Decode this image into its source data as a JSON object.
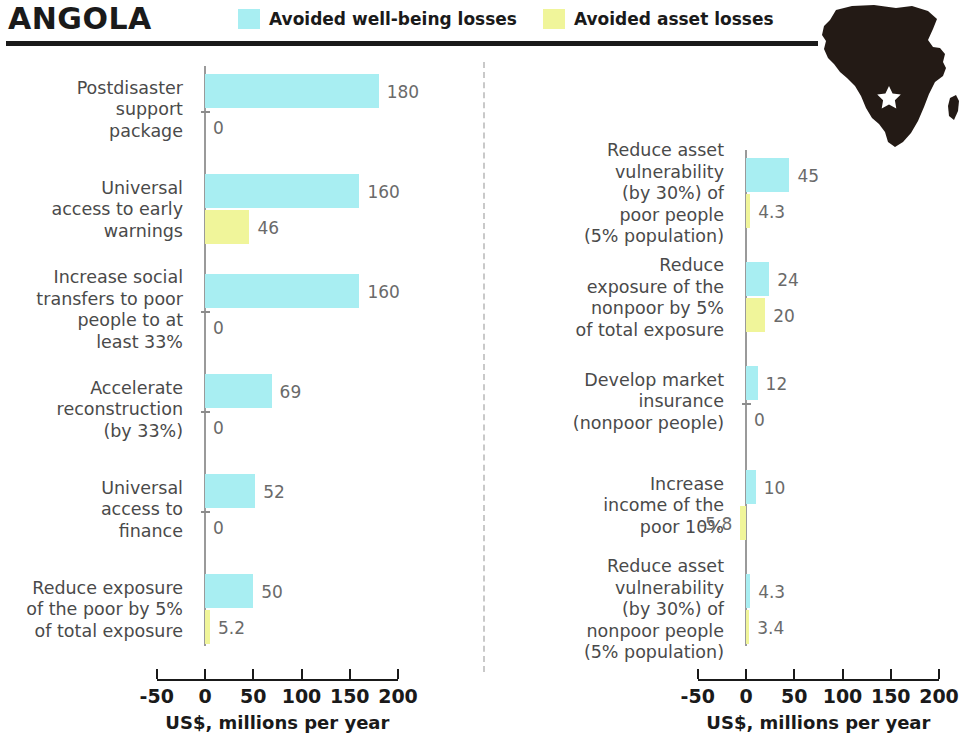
{
  "header": {
    "country": "ANGOLA",
    "legend": [
      {
        "label": "Avoided well-being losses",
        "color": "#A8EEF2",
        "icon": "legend-swatch-wellbeing"
      },
      {
        "label": "Avoided asset losses",
        "color": "#F0F59A",
        "icon": "legend-swatch-asset"
      }
    ]
  },
  "map": {
    "icon": "africa-map-icon",
    "marker": "angola-star-marker",
    "fill": "#231a15",
    "marker_fill": "#ffffff"
  },
  "axis": {
    "title": "US$, millions per year",
    "ticks": [
      -50,
      0,
      50,
      100,
      150,
      200
    ],
    "tick_labels": [
      "-50",
      "0",
      "50",
      "100",
      "150",
      "200"
    ],
    "min": -50,
    "max": 200
  },
  "chart_data": {
    "type": "bar",
    "title": "ANGOLA",
    "xlabel": "US$, millions per year",
    "ylabel": "",
    "xlim": [
      -50,
      200
    ],
    "orientation": "horizontal",
    "grid": false,
    "legend_position": "top",
    "series": [
      {
        "name": "Avoided well-being losses",
        "color": "#A8EEF2"
      },
      {
        "name": "Avoided asset losses",
        "color": "#F0F59A"
      }
    ],
    "panels": [
      {
        "name": "left",
        "groups": [
          {
            "label": "Postdisaster support package",
            "label_lines": [
              "Postdisaster",
              "support",
              "package"
            ],
            "wellbeing": 180,
            "wellbeing_text": "180",
            "asset": 0,
            "asset_text": "0"
          },
          {
            "label": "Universal access to early warnings",
            "label_lines": [
              "Universal",
              "access to early",
              "warnings"
            ],
            "wellbeing": 160,
            "wellbeing_text": "160",
            "asset": 46,
            "asset_text": "46"
          },
          {
            "label": "Increase social transfers to poor people to at least 33%",
            "label_lines": [
              "Increase social",
              "transfers to poor",
              "people to at",
              "least 33%"
            ],
            "wellbeing": 160,
            "wellbeing_text": "160",
            "asset": 0,
            "asset_text": "0"
          },
          {
            "label": "Accelerate reconstruction (by 33%)",
            "label_lines": [
              "Accelerate",
              "reconstruction",
              "(by 33%)"
            ],
            "wellbeing": 69,
            "wellbeing_text": "69",
            "asset": 0,
            "asset_text": "0"
          },
          {
            "label": "Universal access to finance",
            "label_lines": [
              "Universal",
              "access to",
              "finance"
            ],
            "wellbeing": 52,
            "wellbeing_text": "52",
            "asset": 0,
            "asset_text": "0"
          },
          {
            "label": "Reduce exposure of the poor by 5% of total exposure",
            "label_lines": [
              "Reduce exposure",
              "of the poor by 5%",
              "of total exposure"
            ],
            "wellbeing": 50,
            "wellbeing_text": "50",
            "asset": 5.2,
            "asset_text": "5.2"
          }
        ]
      },
      {
        "name": "right",
        "groups": [
          {
            "label": "Reduce asset vulnerability (by 30%) of poor people (5% population)",
            "label_lines": [
              "Reduce asset",
              "vulnerability",
              "(by 30%) of",
              "poor people",
              "(5% population)"
            ],
            "wellbeing": 45,
            "wellbeing_text": "45",
            "asset": 4.3,
            "asset_text": "4.3"
          },
          {
            "label": "Reduce exposure of the nonpoor by 5% of total exposure",
            "label_lines": [
              "Reduce",
              "exposure of the",
              "nonpoor by 5%",
              "of total exposure"
            ],
            "wellbeing": 24,
            "wellbeing_text": "24",
            "asset": 20,
            "asset_text": "20"
          },
          {
            "label": "Develop market insurance (nonpoor people)",
            "label_lines": [
              "Develop market",
              "insurance",
              "(nonpoor people)"
            ],
            "wellbeing": 12,
            "wellbeing_text": "12",
            "asset": 0,
            "asset_text": "0"
          },
          {
            "label": "Increase income of the poor 10%",
            "label_lines": [
              "Increase",
              "income of the",
              "poor 10%"
            ],
            "wellbeing": 10,
            "wellbeing_text": "10",
            "asset": -5.8,
            "asset_text": "-5.8"
          },
          {
            "label": "Reduce asset vulnerability (by 30%) of nonpoor people (5% population)",
            "label_lines": [
              "Reduce asset",
              "vulnerability",
              "(by 30%) of",
              "nonpoor people",
              "(5% population)"
            ],
            "wellbeing": 4.3,
            "wellbeing_text": "4.3",
            "asset": 3.4,
            "asset_text": "3.4"
          }
        ]
      }
    ]
  }
}
